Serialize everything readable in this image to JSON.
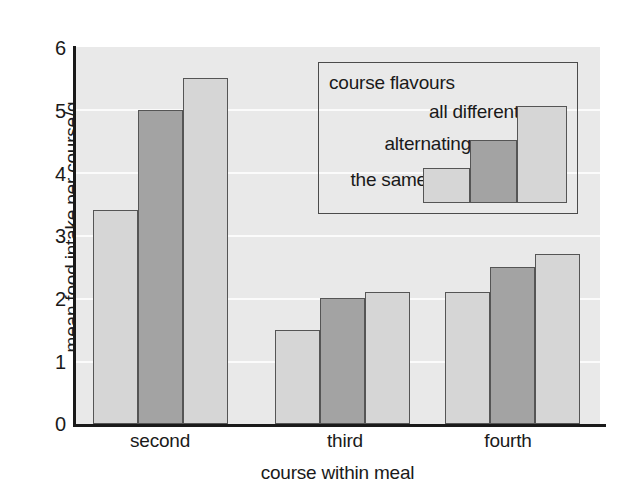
{
  "chart_data": {
    "type": "bar",
    "title": "",
    "xlabel": "course within meal",
    "ylabel": "mean food intake per course/g",
    "categories": [
      "second",
      "third",
      "fourth"
    ],
    "ylim": [
      0,
      6
    ],
    "yticks": [
      "0",
      "1",
      "2",
      "3",
      "4",
      "5",
      "6"
    ],
    "grid": true,
    "legend_position": "inside-top-right",
    "legend_title": "course flavours",
    "series": [
      {
        "name": "the same",
        "values": [
          3.4,
          1.5,
          2.1
        ],
        "color": "#d6d6d6"
      },
      {
        "name": "alternating",
        "values": [
          5.0,
          2.0,
          2.5
        ],
        "color": "#a3a3a3"
      },
      {
        "name": "all different",
        "values": [
          5.5,
          2.1,
          2.7
        ],
        "color": "#d6d6d6"
      }
    ]
  },
  "colors": {
    "plot_background": "#e9e9e9",
    "gridline": "#fbfbfb",
    "axis": "#1a1a1a",
    "bar_light": "#d6d6d6",
    "bar_dark": "#a3a3a3",
    "bar_outline": "#555555",
    "legend_border": "#4b4b4b",
    "text": "#1a1a1a"
  },
  "legend": {
    "title": "course flavours",
    "entries": [
      {
        "label": "the same",
        "swatch": "#d6d6d6"
      },
      {
        "label": "alternating",
        "swatch": "#a3a3a3"
      },
      {
        "label": "all different",
        "swatch": "#d6d6d6"
      }
    ]
  },
  "axes": {
    "y_title": "mean food intake per course/g",
    "x_title": "course within meal",
    "y_ticks": [
      "6",
      "5",
      "4",
      "3",
      "2",
      "1",
      "0"
    ],
    "x_ticks": [
      "second",
      "third",
      "fourth"
    ]
  }
}
